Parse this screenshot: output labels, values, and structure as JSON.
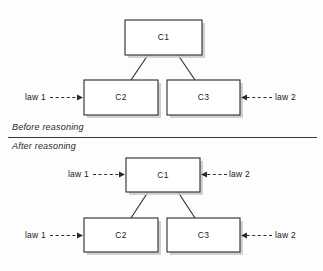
{
  "figure": {
    "title": "",
    "background_color": "#fdfdfd",
    "ink_color": "#2b2b2b"
  },
  "sections": [
    {
      "id": "before",
      "caption": "Before reasoning",
      "caption_x": 12,
      "caption_y": 128
    },
    {
      "id": "after",
      "caption": "After reasoning",
      "caption_x": 12,
      "caption_y": 147
    }
  ],
  "divider": {
    "x1": 8,
    "x2": 317,
    "y": 137.5
  },
  "diagrams": {
    "before": {
      "nodes": [
        {
          "id": "c1",
          "label": "C1",
          "x": 125,
          "y": 20,
          "w": 77,
          "h": 35
        },
        {
          "id": "c2",
          "label": "C2",
          "x": 84,
          "y": 80,
          "w": 74,
          "h": 35
        },
        {
          "id": "c3",
          "label": "C3",
          "x": 167,
          "y": 80,
          "w": 73,
          "h": 35
        }
      ],
      "connectors": [
        {
          "from": "c1",
          "to": "c2",
          "x1": 148,
          "y1": 55,
          "x2": 131,
          "y2": 80
        },
        {
          "from": "c1",
          "to": "c3",
          "x1": 178,
          "y1": 55,
          "x2": 195,
          "y2": 80
        }
      ],
      "annotations": [
        {
          "id": "law1-c2",
          "label": "law 1",
          "text_x": 25,
          "text_y": 97.5,
          "anchor": "start",
          "line_x1": 50,
          "line_x2": 83,
          "line_y": 97.5,
          "direction": "right"
        },
        {
          "id": "law2-c3",
          "label": "law 2",
          "text_x": 275,
          "text_y": 97.5,
          "anchor": "start",
          "line_x1": 272,
          "line_x2": 241,
          "line_y": 97.5,
          "direction": "left"
        }
      ]
    },
    "after": {
      "nodes": [
        {
          "id": "c1",
          "label": "C1",
          "x": 126,
          "y": 158,
          "w": 74,
          "h": 34
        },
        {
          "id": "c2",
          "label": "C2",
          "x": 84,
          "y": 218,
          "w": 74,
          "h": 34
        },
        {
          "id": "c3",
          "label": "C3",
          "x": 167,
          "y": 218,
          "w": 73,
          "h": 34
        }
      ],
      "connectors": [
        {
          "from": "c1",
          "to": "c2",
          "x1": 148,
          "y1": 192,
          "x2": 131,
          "y2": 218
        },
        {
          "from": "c1",
          "to": "c3",
          "x1": 178,
          "y1": 192,
          "x2": 195,
          "y2": 218
        }
      ],
      "annotations": [
        {
          "id": "law1-c1",
          "label": "law 1",
          "text_x": 68,
          "text_y": 174.5,
          "anchor": "start",
          "line_x1": 93,
          "line_x2": 125,
          "line_y": 174.5,
          "direction": "right"
        },
        {
          "id": "law2-c1",
          "label": "law 2",
          "text_x": 229,
          "text_y": 174.5,
          "anchor": "start",
          "line_x1": 227,
          "line_x2": 201,
          "line_y": 174.5,
          "direction": "left"
        },
        {
          "id": "law1-c2",
          "label": "law 1",
          "text_x": 25,
          "text_y": 235.5,
          "anchor": "start",
          "line_x1": 50,
          "line_x2": 83,
          "line_y": 235.5,
          "direction": "right"
        },
        {
          "id": "law2-c3",
          "label": "law 2",
          "text_x": 275,
          "text_y": 235.5,
          "anchor": "start",
          "line_x1": 272,
          "line_x2": 241,
          "line_y": 235.5,
          "direction": "left"
        }
      ]
    }
  }
}
